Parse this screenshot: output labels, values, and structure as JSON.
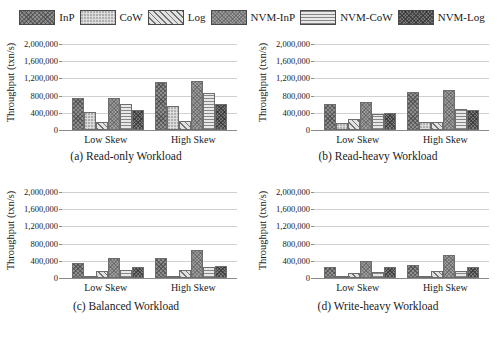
{
  "legend": {
    "items": [
      {
        "label": "InP",
        "pattern": "dense-crosshatch-dark",
        "color": "#8e8e8e"
      },
      {
        "label": "CoW",
        "pattern": "light-dotted",
        "color": "#dcdcdc"
      },
      {
        "label": "Log",
        "pattern": "diagonal-stripes",
        "color": "#e2e2e2"
      },
      {
        "label": "NVM-InP",
        "pattern": "medium-speckle",
        "color": "#9e9e9e"
      },
      {
        "label": "NVM-CoW",
        "pattern": "horizontal-lines",
        "color": "#e8e8e8"
      },
      {
        "label": "NVM-Log",
        "pattern": "dense-crosshatch-darkest",
        "color": "#7b7b7b"
      }
    ]
  },
  "chart_data": [
    {
      "type": "bar",
      "title": "(a) Read-only Workload",
      "xlabel": "",
      "ylabel": "Throughput (txn/s)",
      "categories": [
        "Low Skew",
        "High Skew"
      ],
      "ylim": [
        0,
        2000000
      ],
      "yticks": [
        0,
        400000,
        800000,
        1200000,
        1600000,
        2000000
      ],
      "ytick_labels": [
        "0",
        "400,000",
        "800,000",
        "1,200,000",
        "1,600,000",
        "2,000,000"
      ],
      "grid": true,
      "legend_position": "top-center",
      "series": [
        {
          "name": "InP",
          "values": [
            750000,
            1120000
          ]
        },
        {
          "name": "CoW",
          "values": [
            415000,
            565000
          ]
        },
        {
          "name": "Log",
          "values": [
            175000,
            205000
          ]
        },
        {
          "name": "NVM-InP",
          "values": [
            745000,
            1130000
          ]
        },
        {
          "name": "NVM-CoW",
          "values": [
            595000,
            860000
          ]
        },
        {
          "name": "NVM-Log",
          "values": [
            470000,
            605000
          ]
        }
      ]
    },
    {
      "type": "bar",
      "title": "(b) Read-heavy Workload",
      "xlabel": "",
      "ylabel": "Throughput (txn/s)",
      "categories": [
        "Low Skew",
        "High Skew"
      ],
      "ylim": [
        0,
        2000000
      ],
      "yticks": [
        0,
        400000,
        800000,
        1200000,
        1600000,
        2000000
      ],
      "ytick_labels": [
        "0",
        "400,000",
        "800,000",
        "1,200,000",
        "1,600,000",
        "2,000,000"
      ],
      "grid": true,
      "legend_position": "top-center",
      "series": [
        {
          "name": "InP",
          "values": [
            595000,
            885000
          ]
        },
        {
          "name": "CoW",
          "values": [
            155000,
            195000
          ]
        },
        {
          "name": "Log",
          "values": [
            250000,
            190000
          ]
        },
        {
          "name": "NVM-InP",
          "values": [
            640000,
            940000
          ]
        },
        {
          "name": "NVM-CoW",
          "values": [
            370000,
            500000
          ]
        },
        {
          "name": "NVM-Log",
          "values": [
            390000,
            465000
          ]
        }
      ]
    },
    {
      "type": "bar",
      "title": "(c) Balanced Workload",
      "xlabel": "",
      "ylabel": "Throughput (txn/s)",
      "categories": [
        "Low Skew",
        "High Skew"
      ],
      "ylim": [
        0,
        2000000
      ],
      "yticks": [
        0,
        400000,
        800000,
        1200000,
        1600000,
        2000000
      ],
      "ytick_labels": [
        "0",
        "400,000",
        "800,000",
        "1,200,000",
        "1,600,000",
        "2,000,000"
      ],
      "grid": true,
      "legend_position": "top-center",
      "series": [
        {
          "name": "InP",
          "values": [
            340000,
            460000
          ]
        },
        {
          "name": "CoW",
          "values": [
            35000,
            50000
          ]
        },
        {
          "name": "Log",
          "values": [
            165000,
            180000
          ]
        },
        {
          "name": "NVM-InP",
          "values": [
            475000,
            640000
          ]
        },
        {
          "name": "NVM-CoW",
          "values": [
            185000,
            250000
          ]
        },
        {
          "name": "NVM-Log",
          "values": [
            255000,
            290000
          ]
        }
      ]
    },
    {
      "type": "bar",
      "title": "(d) Write-heavy Workload",
      "xlabel": "",
      "ylabel": "Throughput (txn/s)",
      "categories": [
        "Low Skew",
        "High Skew"
      ],
      "ylim": [
        0,
        2000000
      ],
      "yticks": [
        0,
        400000,
        800000,
        1200000,
        1600000,
        2000000
      ],
      "ytick_labels": [
        "0",
        "400,000",
        "800,000",
        "1,200,000",
        "1,600,000",
        "2,000,000"
      ],
      "grid": true,
      "legend_position": "top-center",
      "series": [
        {
          "name": "InP",
          "values": [
            245000,
            305000
          ]
        },
        {
          "name": "CoW",
          "values": [
            20000,
            25000
          ]
        },
        {
          "name": "Log",
          "values": [
            110000,
            165000
          ]
        },
        {
          "name": "NVM-InP",
          "values": [
            400000,
            535000
          ]
        },
        {
          "name": "NVM-CoW",
          "values": [
            130000,
            170000
          ]
        },
        {
          "name": "NVM-Log",
          "values": [
            260000,
            255000
          ]
        }
      ]
    }
  ]
}
